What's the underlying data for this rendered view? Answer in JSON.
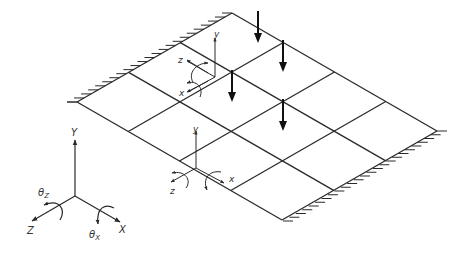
{
  "diagram": {
    "stroke_color": "#2a2a2a",
    "mesh": {
      "rows": 3,
      "cols": 4,
      "corners": {
        "left": [
          77,
          102
        ],
        "top": [
          232,
          13
        ],
        "right": [
          437,
          131
        ],
        "bottom": [
          283,
          221
        ]
      }
    },
    "supports": [
      {
        "edge": "left-top",
        "type": "fixed"
      },
      {
        "edge": "bottom-right",
        "type": "fixed"
      }
    ],
    "loads": [
      {
        "node": "r0c1",
        "label": "point-load"
      },
      {
        "node": "r1c2",
        "label": "point-load"
      },
      {
        "node": "r1c1",
        "label": "point-load"
      },
      {
        "node": "r2c2",
        "label": "point-load"
      }
    ],
    "local_axes_top": {
      "y": "y",
      "z": "z",
      "x": "x"
    },
    "local_axes_bottom": {
      "y": "y",
      "z": "z",
      "x": "x"
    },
    "global_axes": {
      "y": "Y",
      "z": "Z",
      "x": "X",
      "theta_z": "θ",
      "theta_z_sub": "Z",
      "theta_x": "θ",
      "theta_x_sub": "X"
    }
  }
}
